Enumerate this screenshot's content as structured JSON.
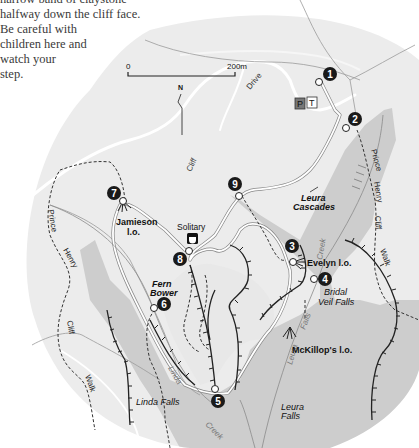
{
  "intro": {
    "lines": [
      "narrow band of claystone",
      "halfway down the cliff face.",
      "Be careful with",
      "children here and",
      "watch your",
      "step."
    ]
  },
  "scale_bar": {
    "start_label": "0",
    "end_label": "200m"
  },
  "north_arrow": {
    "label": "N"
  },
  "facilities": {
    "parking": "P",
    "toilets": "T"
  },
  "roads": {
    "drive_label": "Drive",
    "cliff_label": "Cliff"
  },
  "walks": {
    "east": [
      "Prince",
      "Henry",
      "Cliff",
      "Walk"
    ],
    "west": [
      "Prince",
      "Henry",
      "Cliff",
      "Walk"
    ]
  },
  "markers": [
    {
      "num": "1"
    },
    {
      "num": "2"
    },
    {
      "num": "3"
    },
    {
      "num": "4"
    },
    {
      "num": "5"
    },
    {
      "num": "6"
    },
    {
      "num": "7"
    },
    {
      "num": "8"
    },
    {
      "num": "9"
    }
  ],
  "places": {
    "jamieson": [
      "Jamieson",
      "l.o."
    ],
    "solitary": "Solitary",
    "fern_bower": [
      "Fern",
      "Bower"
    ],
    "leura_cascades": [
      "Leura",
      "Cascades"
    ],
    "evelyn": "Evelyn l.o.",
    "bridal_veil": [
      "Bridal",
      "Veil Falls"
    ],
    "mckillops": "McKillop's l.o.",
    "linda_falls": "Linda Falls",
    "leura_falls": [
      "Leura",
      "Falls"
    ]
  },
  "creeks": {
    "leura_creek": "Creek",
    "leura_falls_creek_a": "Leura",
    "leura_falls_creek_b": "Falls",
    "linda": "Linda",
    "linda_creek": "Creek"
  },
  "colors": {
    "land": "#ededed",
    "valley": "#cfcfcf",
    "marker": "#1a1a1a",
    "road": "#ffffff",
    "track": "#333333"
  }
}
